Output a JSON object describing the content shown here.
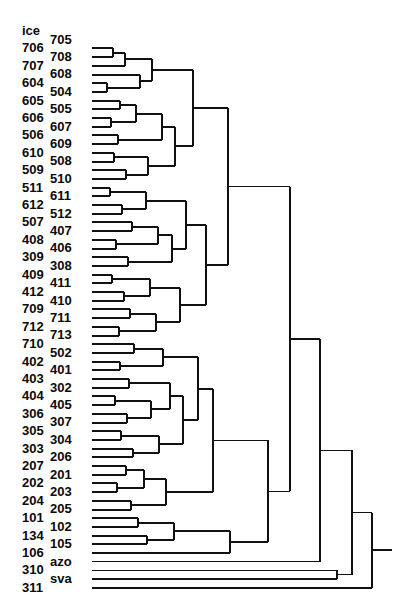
{
  "figure": {
    "kind": "dendrogram",
    "title": "",
    "orientation": "horizontal-right",
    "background_color": "#ffffff",
    "line_color": "#111111",
    "label_color": "#0a0a0a",
    "width": 413,
    "height": 616,
    "caption": ""
  },
  "chart_data": {
    "type": "dendrogram",
    "title": "",
    "xlabel": "",
    "ylabel": "",
    "orientation": "leaves-left-root-right",
    "leaf_count": 54,
    "leaf_labels": [
      "ice",
      "705",
      "706",
      "708",
      "707",
      "608",
      "604",
      "504",
      "605",
      "505",
      "606",
      "607",
      "506",
      "609",
      "610",
      "508",
      "509",
      "510",
      "511",
      "611",
      "612",
      "512",
      "507",
      "407",
      "408",
      "406",
      "309",
      "308",
      "409",
      "411",
      "412",
      "410",
      "709",
      "711",
      "712",
      "713",
      "710",
      "502",
      "402",
      "401",
      "403",
      "302",
      "404",
      "405",
      "306",
      "307",
      "305",
      "304",
      "303",
      "206",
      "207",
      "201",
      "202",
      "203",
      "204",
      "205",
      "101",
      "102",
      "134",
      "105",
      "106",
      "azo",
      "310",
      "sva",
      "311"
    ],
    "label_column_order": [
      "left",
      "right",
      "left",
      "right",
      "left",
      "right",
      "left",
      "right",
      "left",
      "right",
      "left",
      "right",
      "left",
      "right",
      "left",
      "right",
      "left",
      "right",
      "left",
      "right",
      "left",
      "right",
      "left",
      "right",
      "left",
      "right",
      "left",
      "right",
      "left",
      "right",
      "left",
      "right",
      "left",
      "right",
      "left",
      "right",
      "left",
      "right",
      "left",
      "right",
      "left",
      "right",
      "left",
      "right",
      "left",
      "right",
      "left",
      "right",
      "left",
      "right",
      "left",
      "right",
      "left",
      "right",
      "left",
      "right",
      "left",
      "right",
      "left",
      "right",
      "left",
      "right",
      "left",
      "right",
      "left"
    ],
    "x_axis_label": "",
    "axis_visible": false,
    "grid": false
  },
  "leaves": [
    {
      "id": "ice",
      "row": 0,
      "col": "left"
    },
    {
      "id": "705",
      "row": 1,
      "col": "right"
    },
    {
      "id": "706",
      "row": 2,
      "col": "left"
    },
    {
      "id": "708",
      "row": 3,
      "col": "right"
    },
    {
      "id": "707",
      "row": 4,
      "col": "left"
    },
    {
      "id": "608",
      "row": 5,
      "col": "right"
    },
    {
      "id": "604",
      "row": 6,
      "col": "left"
    },
    {
      "id": "504",
      "row": 7,
      "col": "right"
    },
    {
      "id": "605",
      "row": 8,
      "col": "left"
    },
    {
      "id": "505",
      "row": 9,
      "col": "right"
    },
    {
      "id": "606",
      "row": 10,
      "col": "left"
    },
    {
      "id": "607",
      "row": 11,
      "col": "right"
    },
    {
      "id": "506",
      "row": 12,
      "col": "left"
    },
    {
      "id": "609",
      "row": 13,
      "col": "right"
    },
    {
      "id": "610",
      "row": 14,
      "col": "left"
    },
    {
      "id": "508",
      "row": 15,
      "col": "right"
    },
    {
      "id": "509",
      "row": 16,
      "col": "left"
    },
    {
      "id": "510",
      "row": 17,
      "col": "right"
    },
    {
      "id": "511",
      "row": 18,
      "col": "left"
    },
    {
      "id": "611",
      "row": 19,
      "col": "right"
    },
    {
      "id": "612",
      "row": 20,
      "col": "left"
    },
    {
      "id": "512",
      "row": 21,
      "col": "right"
    },
    {
      "id": "507",
      "row": 22,
      "col": "left"
    },
    {
      "id": "407",
      "row": 23,
      "col": "right"
    },
    {
      "id": "408",
      "row": 24,
      "col": "left"
    },
    {
      "id": "406",
      "row": 25,
      "col": "right"
    },
    {
      "id": "309",
      "row": 26,
      "col": "left"
    },
    {
      "id": "308",
      "row": 27,
      "col": "right"
    },
    {
      "id": "409",
      "row": 28,
      "col": "left"
    },
    {
      "id": "411",
      "row": 29,
      "col": "right"
    },
    {
      "id": "412",
      "row": 30,
      "col": "left"
    },
    {
      "id": "410",
      "row": 31,
      "col": "right"
    },
    {
      "id": "709",
      "row": 32,
      "col": "left"
    },
    {
      "id": "711",
      "row": 33,
      "col": "right"
    },
    {
      "id": "712",
      "row": 34,
      "col": "left"
    },
    {
      "id": "713",
      "row": 35,
      "col": "right"
    },
    {
      "id": "710",
      "row": 36,
      "col": "left"
    },
    {
      "id": "502",
      "row": 37,
      "col": "right"
    },
    {
      "id": "402",
      "row": 38,
      "col": "left"
    },
    {
      "id": "401",
      "row": 39,
      "col": "right"
    },
    {
      "id": "403",
      "row": 40,
      "col": "left"
    },
    {
      "id": "302",
      "row": 41,
      "col": "right"
    },
    {
      "id": "404",
      "row": 42,
      "col": "left"
    },
    {
      "id": "405",
      "row": 43,
      "col": "right"
    },
    {
      "id": "306",
      "row": 44,
      "col": "left"
    },
    {
      "id": "307",
      "row": 45,
      "col": "right"
    },
    {
      "id": "305",
      "row": 46,
      "col": "left"
    },
    {
      "id": "304",
      "row": 47,
      "col": "right"
    },
    {
      "id": "303",
      "row": 48,
      "col": "left"
    },
    {
      "id": "206",
      "row": 49,
      "col": "right"
    },
    {
      "id": "207",
      "row": 50,
      "col": "left"
    },
    {
      "id": "201",
      "row": 51,
      "col": "right"
    },
    {
      "id": "202",
      "row": 52,
      "col": "left"
    },
    {
      "id": "203",
      "row": 53,
      "col": "right"
    },
    {
      "id": "204",
      "row": 54,
      "col": "left"
    },
    {
      "id": "205",
      "row": 55,
      "col": "right"
    },
    {
      "id": "101",
      "row": 56,
      "col": "left"
    },
    {
      "id": "102",
      "row": 57,
      "col": "right"
    },
    {
      "id": "134",
      "row": 58,
      "col": "left"
    },
    {
      "id": "105",
      "row": 59,
      "col": "right"
    },
    {
      "id": "106",
      "row": 60,
      "col": "left"
    },
    {
      "id": "azo",
      "row": 61,
      "col": "right"
    },
    {
      "id": "310",
      "row": 62,
      "col": "left"
    },
    {
      "id": "sva",
      "row": 63,
      "col": "right"
    },
    {
      "id": "311",
      "row": 64,
      "col": "left"
    }
  ],
  "merges": [
    {
      "id": "m1",
      "a": "706",
      "b": "708",
      "x": 113
    },
    {
      "id": "m2",
      "a": "m1",
      "b": "707",
      "x": 125
    },
    {
      "id": "m3",
      "a": "604",
      "b": "504",
      "x": 107
    },
    {
      "id": "m4",
      "a": "608",
      "b": "m3",
      "x": 140
    },
    {
      "id": "m5",
      "a": "m2",
      "b": "m4",
      "x": 152
    },
    {
      "id": "m6",
      "a": "605",
      "b": "505",
      "x": 120
    },
    {
      "id": "m7",
      "a": "606",
      "b": "607",
      "x": 111
    },
    {
      "id": "m8",
      "a": "m6",
      "b": "m7",
      "x": 136
    },
    {
      "id": "m9",
      "a": "506",
      "b": "609",
      "x": 118
    },
    {
      "id": "m10",
      "a": "m8",
      "b": "m9",
      "x": 162
    },
    {
      "id": "m11",
      "a": "610",
      "b": "508",
      "x": 114
    },
    {
      "id": "m12",
      "a": "509",
      "b": "510",
      "x": 126
    },
    {
      "id": "m13",
      "a": "m11",
      "b": "m12",
      "x": 148
    },
    {
      "id": "m14",
      "a": "m10",
      "b": "m13",
      "x": 175
    },
    {
      "id": "m15",
      "a": "m5",
      "b": "m14",
      "x": 193
    },
    {
      "id": "m16",
      "a": "511",
      "b": "611",
      "x": 110
    },
    {
      "id": "m17",
      "a": "612",
      "b": "512",
      "x": 122
    },
    {
      "id": "m18",
      "a": "m16",
      "b": "m17",
      "x": 146
    },
    {
      "id": "m19",
      "a": "507",
      "b": "407",
      "x": 132
    },
    {
      "id": "m20",
      "a": "408",
      "b": "406",
      "x": 116
    },
    {
      "id": "m21",
      "a": "m19",
      "b": "m20",
      "x": 158
    },
    {
      "id": "m22",
      "a": "309",
      "b": "308",
      "x": 128
    },
    {
      "id": "m23",
      "a": "m21",
      "b": "m22",
      "x": 172
    },
    {
      "id": "m24",
      "a": "m18",
      "b": "m23",
      "x": 186
    },
    {
      "id": "m25",
      "a": "409",
      "b": "411",
      "x": 112
    },
    {
      "id": "m26",
      "a": "412",
      "b": "410",
      "x": 124
    },
    {
      "id": "m27",
      "a": "m25",
      "b": "m26",
      "x": 150
    },
    {
      "id": "m28",
      "a": "709",
      "b": "711",
      "x": 130
    },
    {
      "id": "m29",
      "a": "712",
      "b": "713",
      "x": 119
    },
    {
      "id": "m30",
      "a": "m28",
      "b": "m29",
      "x": 156
    },
    {
      "id": "m31",
      "a": "m27",
      "b": "m30",
      "x": 180
    },
    {
      "id": "m32",
      "a": "m24",
      "b": "m31",
      "x": 206
    },
    {
      "id": "m33",
      "a": "m15",
      "b": "m32",
      "x": 228
    },
    {
      "id": "m34",
      "a": "710",
      "b": "502",
      "x": 134
    },
    {
      "id": "m35",
      "a": "402",
      "b": "401",
      "x": 120
    },
    {
      "id": "m36",
      "a": "m34",
      "b": "m35",
      "x": 163
    },
    {
      "id": "m37",
      "a": "403",
      "b": "302",
      "x": 129
    },
    {
      "id": "m38",
      "a": "404",
      "b": "405",
      "x": 115
    },
    {
      "id": "m39",
      "a": "306",
      "b": "307",
      "x": 127
    },
    {
      "id": "m40",
      "a": "m38",
      "b": "m39",
      "x": 151
    },
    {
      "id": "m41",
      "a": "m37",
      "b": "m40",
      "x": 170
    },
    {
      "id": "m42",
      "a": "305",
      "b": "304",
      "x": 121
    },
    {
      "id": "m43",
      "a": "303",
      "b": "206",
      "x": 133
    },
    {
      "id": "m44",
      "a": "m42",
      "b": "m43",
      "x": 159
    },
    {
      "id": "m45",
      "a": "m41",
      "b": "m44",
      "x": 183
    },
    {
      "id": "m46",
      "a": "m36",
      "b": "m45",
      "x": 198
    },
    {
      "id": "m47",
      "a": "207",
      "b": "201",
      "x": 126
    },
    {
      "id": "m48",
      "a": "202",
      "b": "203",
      "x": 117
    },
    {
      "id": "m49",
      "a": "m47",
      "b": "m48",
      "x": 144
    },
    {
      "id": "m50",
      "a": "204",
      "b": "205",
      "x": 131
    },
    {
      "id": "m51",
      "a": "m49",
      "b": "m50",
      "x": 166
    },
    {
      "id": "m52",
      "a": "m46",
      "b": "m51",
      "x": 213
    },
    {
      "id": "m53",
      "a": "101",
      "b": "102",
      "x": 138
    },
    {
      "id": "m54",
      "a": "134",
      "b": "105",
      "x": 147
    },
    {
      "id": "m55",
      "a": "m53",
      "b": "m54",
      "x": 174
    },
    {
      "id": "m56",
      "a": "m55",
      "b": "106",
      "x": 230
    },
    {
      "id": "m57",
      "a": "m52",
      "b": "m56",
      "x": 268
    },
    {
      "id": "m58",
      "a": "m33",
      "b": "m57",
      "x": 290
    },
    {
      "id": "m59",
      "a": "m58",
      "b": "azo",
      "x": 320
    },
    {
      "id": "m60",
      "a": "310",
      "b": "sva",
      "x": 337
    },
    {
      "id": "m61",
      "a": "m59",
      "b": "m60",
      "x": 352
    },
    {
      "id": "m62",
      "a": "m61",
      "b": "311",
      "x": 372
    }
  ],
  "geometry": {
    "leaf_x": 92,
    "first_row_y": 31,
    "row_spacing": 8.7,
    "label_left_x": 22,
    "label_right_x": 50,
    "label_font_size": 13,
    "line_width": 2.0,
    "root_line_width": 1.4,
    "root_stub_x": 392
  }
}
